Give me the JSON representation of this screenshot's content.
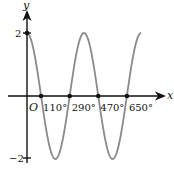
{
  "chart_data": {
    "type": "line",
    "title": "",
    "function": "y = 2cos(x - 20°)",
    "xlabel": "x",
    "ylabel": "y",
    "origin_label": "O",
    "x_unit": "degrees",
    "x_ticks": [
      110,
      290,
      470,
      650
    ],
    "x_tick_labels": [
      "110°",
      "290°",
      "470°",
      "650°"
    ],
    "y_ticks": [
      2,
      -2
    ],
    "y_tick_labels": [
      "2",
      "−2"
    ],
    "xlim": [
      -20,
      800
    ],
    "ylim": [
      -2.3,
      2.7
    ],
    "amplitude": 2,
    "period_deg": 360,
    "phase_shift_deg": 20,
    "x_range_drawn": [
      20,
      740
    ],
    "series": [
      {
        "name": "curve",
        "x": [
          20,
          110,
          200,
          290,
          380,
          470,
          560,
          650,
          740
        ],
        "y": [
          2,
          0,
          -2,
          0,
          2,
          0,
          -2,
          0,
          2
        ]
      }
    ],
    "zero_points": [
      110,
      290,
      470,
      650
    ],
    "grid": false,
    "legend": null,
    "colors": {
      "curve": "#8a8a8a",
      "axes": "#111111",
      "points": "#111111"
    }
  }
}
